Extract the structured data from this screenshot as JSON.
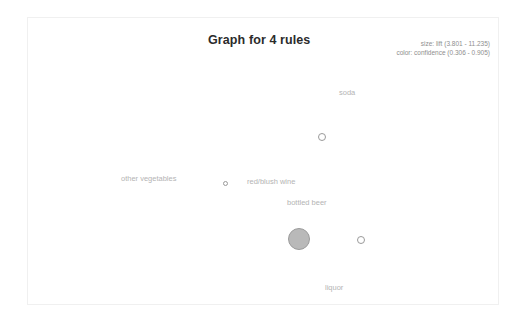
{
  "title": "Graph for 4 rules",
  "legend": {
    "size_line": "size: lift (3.801 - 11.235)",
    "color_line": "color: confidence (0.306 - 0.905)"
  },
  "chart_data": {
    "type": "scatter",
    "title": "Graph for 4 rules",
    "xlabel": "",
    "ylabel": "",
    "grid": false,
    "legend_position": "top-right",
    "size_encoding": {
      "field": "lift",
      "min": 3.801,
      "max": 11.235
    },
    "color_encoding": {
      "field": "confidence",
      "min": 0.306,
      "max": 0.905
    },
    "axes_visible": false,
    "background": "#ffffff",
    "frame_color": "#f0f0f0",
    "points": [
      {
        "label": "soda",
        "x": 322,
        "y": 137,
        "radius": 4,
        "fill": "none",
        "stroke": "#9a9a9a",
        "label_x": 339,
        "label_y": 88,
        "label_color": "#b4b4b4"
      },
      {
        "label": "other vegetables",
        "x": 225,
        "y": 183,
        "radius": 2.5,
        "fill": "none",
        "stroke": "#9a9a9a",
        "label_x": 121,
        "label_y": 174,
        "label_color": "#b4b4b4"
      },
      {
        "label": "red/blush wine",
        "x": 225,
        "y": 183,
        "radius": 2.5,
        "fill": "none",
        "stroke": "#9a9a9a",
        "label_x": 247,
        "label_y": 177,
        "label_color": "#b4b4b4"
      },
      {
        "label": "bottled beer",
        "x": 361,
        "y": 240,
        "radius": 4,
        "fill": "none",
        "stroke": "#9a9a9a",
        "label_x": 287,
        "label_y": 198,
        "label_color": "#b4b4b4"
      },
      {
        "label": "liquor",
        "x": 299,
        "y": 239,
        "radius": 11,
        "fill": "#b9b9b9",
        "stroke": "#9b9b9b",
        "label_x": 325,
        "label_y": 283,
        "label_color": "#b4b4b4"
      }
    ]
  }
}
